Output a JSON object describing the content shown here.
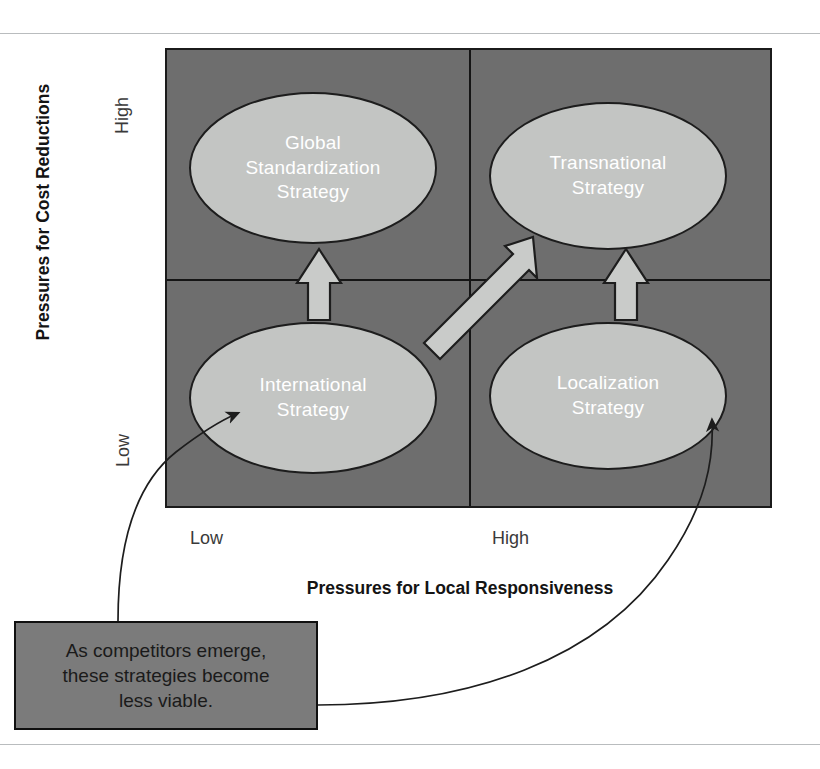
{
  "figure": {
    "type": "2x2-strategy-matrix",
    "y_axis": {
      "title": "Pressures for Cost Reductions",
      "ticks": {
        "high": "High",
        "low": "Low"
      }
    },
    "x_axis": {
      "title": "Pressures for Local Responsiveness",
      "ticks": {
        "low": "Low",
        "high": "High"
      }
    },
    "quadrants": [
      {
        "id": "global-standardization",
        "label": "Global\nStandardization\nStrategy",
        "cost": "High",
        "responsiveness": "Low"
      },
      {
        "id": "transnational",
        "label": "Transnational\nStrategy",
        "cost": "High",
        "responsiveness": "High"
      },
      {
        "id": "international",
        "label": "International\nStrategy",
        "cost": "Low",
        "responsiveness": "Low"
      },
      {
        "id": "localization",
        "label": "Localization\nStrategy",
        "cost": "Low",
        "responsiveness": "High"
      }
    ],
    "bubbles": {
      "global_standardization": "Global Standardization Strategy",
      "global_standardization_l1": "Global",
      "global_standardization_l2": "Standardization",
      "global_standardization_l3": "Strategy",
      "transnational_l1": "Transnational",
      "transnational_l2": "Strategy",
      "international_l1": "International",
      "international_l2": "Strategy",
      "localization_l1": "Localization",
      "localization_l2": "Strategy"
    },
    "arrows": [
      {
        "id": "international-to-global-standardization",
        "direction": "up"
      },
      {
        "id": "international-to-transnational",
        "direction": "diagonal-up-right"
      },
      {
        "id": "localization-to-transnational",
        "direction": "up"
      }
    ],
    "callout": {
      "line1": "As competitors emerge,",
      "line2": "these strategies become",
      "line3": "less viable.",
      "text": "As competitors emerge, these strategies become less viable.",
      "points_to": [
        "International Strategy",
        "Localization Strategy"
      ]
    },
    "colors": {
      "matrix_fill": "#6e6e6e",
      "bubble_fill": "#c3c5c3",
      "bubble_text": "#ffffff",
      "arrow_fill": "#c9cbc9",
      "callout_fill": "#7b7b7b",
      "outline": "#1d1d1d",
      "page_rule": "#b9bcbe"
    }
  }
}
